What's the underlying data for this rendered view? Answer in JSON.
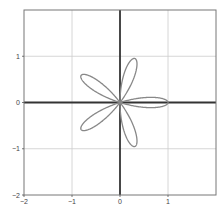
{
  "chart_data": {
    "type": "line",
    "title": "",
    "xlabel": "",
    "ylabel": "",
    "xlim": [
      -2,
      2
    ],
    "ylim": [
      -2,
      2
    ],
    "grid": true,
    "legend": null,
    "x_ticks": [
      -2,
      -1,
      0,
      1
    ],
    "x_tick_labels": [
      "-2",
      "-1",
      "0",
      "1"
    ],
    "y_ticks": [
      -2,
      -1,
      0,
      1
    ],
    "y_tick_labels": [
      "-2",
      "-1",
      "0",
      "1"
    ],
    "series": [
      {
        "name": "rose curve r = cos(5θ)",
        "kind": "polar",
        "equation": "r = cos(5θ)",
        "petals": 5,
        "petal_tip_angles_deg": [
          0,
          72,
          144,
          216,
          288
        ],
        "petal_length": 1,
        "color": "#888888"
      }
    ],
    "colors": {
      "curve": "#888888",
      "axes": "#333333",
      "grid": "#cccccc",
      "frame": "#777777"
    }
  }
}
